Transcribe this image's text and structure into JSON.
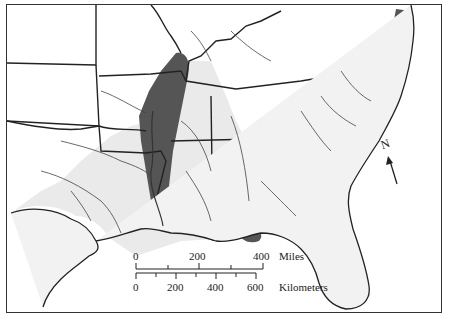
{
  "map": {
    "region": "Southeastern United States",
    "legend": {
      "north_label": "N",
      "scale_bar": {
        "miles": {
          "unit_label": "Miles",
          "ticks": [
            "0",
            "200",
            "400"
          ]
        },
        "kilometers": {
          "unit_label": "Kilometers",
          "ticks": [
            "0",
            "200",
            "400",
            "600"
          ]
        }
      }
    },
    "colors": {
      "dark_fill": "#555555",
      "light_fill": "#eaeaea",
      "border": "#222222",
      "background": "#ffffff"
    }
  }
}
